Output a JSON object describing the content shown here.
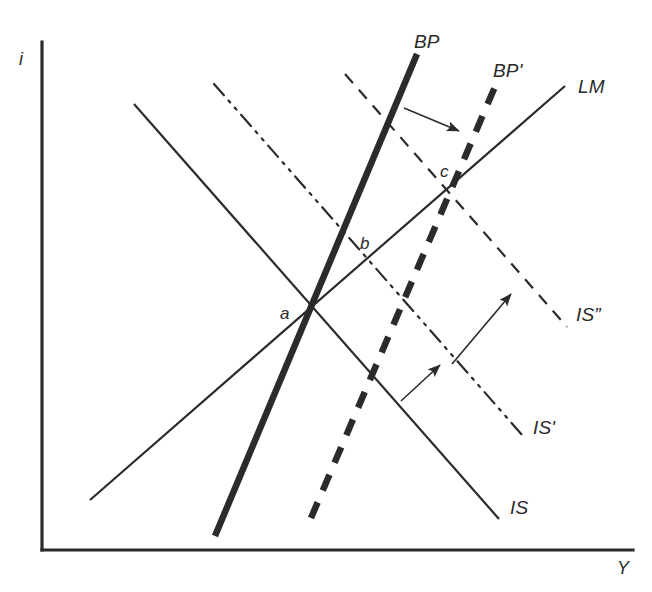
{
  "figure": {
    "background_color": "#ffffff",
    "ink_color": "#2b2b2b"
  },
  "axes": {
    "y_axis_label": "i",
    "x_axis_label": "Y",
    "origin": {
      "x": 42,
      "y": 550
    },
    "y_axis_top": {
      "x": 42,
      "y": 42
    },
    "x_axis_right": {
      "x": 633,
      "y": 550
    }
  },
  "curves": [
    {
      "id": "is",
      "label": "IS",
      "style": "solid",
      "weight": "thin",
      "label_pos": {
        "x": 510,
        "y": 498
      },
      "from": {
        "x": 134,
        "y": 104
      },
      "to": {
        "x": 499,
        "y": 519
      }
    },
    {
      "id": "is-prime",
      "label": "IS'",
      "style": "dash-dot-dot",
      "weight": "thin",
      "label_pos": {
        "x": 533,
        "y": 418
      },
      "from": {
        "x": 214,
        "y": 84
      },
      "to": {
        "x": 523,
        "y": 436
      }
    },
    {
      "id": "is-double-prime",
      "label": "IS”",
      "style": "dashed",
      "weight": "thin",
      "label_pos": {
        "x": 576,
        "y": 305
      },
      "from": {
        "x": 345,
        "y": 74
      },
      "to": {
        "x": 567,
        "y": 327
      }
    },
    {
      "id": "lm",
      "label": "LM",
      "style": "solid",
      "weight": "thin",
      "label_pos": {
        "x": 578,
        "y": 77
      },
      "from": {
        "x": 90,
        "y": 500
      },
      "to": {
        "x": 565,
        "y": 86
      }
    },
    {
      "id": "bp",
      "label": "BP",
      "style": "solid",
      "weight": "thick",
      "label_pos": {
        "x": 414,
        "y": 32
      },
      "from": {
        "x": 215,
        "y": 536
      },
      "to": {
        "x": 417,
        "y": 54
      }
    },
    {
      "id": "bp-prime",
      "label": "BP'",
      "style": "dashed",
      "weight": "thick",
      "label_pos": {
        "x": 493,
        "y": 61
      },
      "from": {
        "x": 311,
        "y": 518
      },
      "to": {
        "x": 497,
        "y": 82
      }
    }
  ],
  "points": [
    {
      "id": "a",
      "label": "a",
      "x": 308,
      "y": 313,
      "label_pos": {
        "x": 280,
        "y": 305
      }
    },
    {
      "id": "b",
      "label": "b",
      "x": 366,
      "y": 260,
      "label_pos": {
        "x": 360,
        "y": 235
      }
    },
    {
      "id": "c",
      "label": "c",
      "x": 452,
      "y": 192,
      "label_pos": {
        "x": 440,
        "y": 163
      }
    }
  ],
  "arrows": [
    {
      "id": "bp-shift-arrow",
      "from": {
        "x": 404,
        "y": 108
      },
      "to": {
        "x": 459,
        "y": 131
      }
    },
    {
      "id": "is-to-is-prime-arrow",
      "from": {
        "x": 401,
        "y": 401
      },
      "to": {
        "x": 440,
        "y": 365
      }
    },
    {
      "id": "is-prime-to-is-double-prime-arrow",
      "from": {
        "x": 452,
        "y": 364
      },
      "to": {
        "x": 511,
        "y": 294
      }
    }
  ]
}
